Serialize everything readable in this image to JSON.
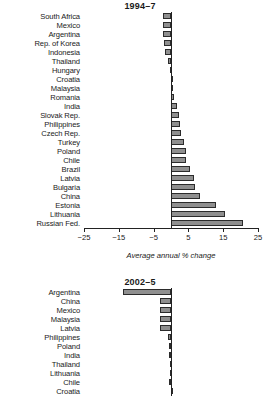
{
  "chart_data": [
    {
      "type": "bar",
      "orientation": "horizontal",
      "title": "1994–7",
      "xlabel": "Average annual % change",
      "ylabel": "",
      "xlim": [
        -25,
        25
      ],
      "xticks": [
        -25,
        -15,
        -5,
        5,
        15,
        25
      ],
      "xtick_labels": [
        "−25",
        "−15",
        "−5",
        "5",
        "15",
        "25"
      ],
      "grid": false,
      "legend": "none",
      "categories": [
        "South Africa",
        "Mexico",
        "Argentina",
        "Rep. of Korea",
        "Indonesia",
        "Thailand",
        "Hungary",
        "Croatia",
        "Malaysia",
        "Romania",
        "India",
        "Slovak Rep.",
        "Philippines",
        "Czech Rep.",
        "Turkey",
        "Poland",
        "Chile",
        "Brazil",
        "Latvia",
        "Bulgaria",
        "China",
        "Estonia",
        "Lithuania",
        "Russian Fed."
      ],
      "values": [
        -2.3,
        -2.3,
        -2.2,
        -2.1,
        -1.8,
        -1.0,
        -0.3,
        0.4,
        0.7,
        0.8,
        1.6,
        2.4,
        2.6,
        2.8,
        3.6,
        4.2,
        4.3,
        5.4,
        6.6,
        7.0,
        8.4,
        12.9,
        15.6,
        20.8
      ]
    },
    {
      "type": "bar",
      "orientation": "horizontal",
      "title": "2002–5",
      "xlabel": "",
      "ylabel": "",
      "xlim": [
        -25,
        25
      ],
      "grid": false,
      "legend": "none",
      "categories": [
        "Argentina",
        "China",
        "Mexico",
        "Malaysia",
        "Latvia",
        "Philippines",
        "Poland",
        "India",
        "Thailand",
        "Lithuania",
        "Chile",
        "Croatia"
      ],
      "values": [
        -13.9,
        -3.3,
        -3.2,
        -3.2,
        -3.1,
        -0.9,
        -0.7,
        -0.5,
        -0.4,
        -0.4,
        -0.5,
        0.6
      ]
    }
  ]
}
